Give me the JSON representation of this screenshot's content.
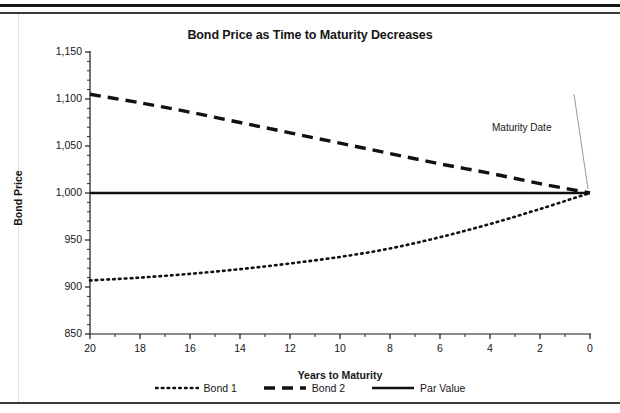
{
  "chart_data": {
    "type": "line",
    "title": "Bond Price as Time to Maturity Decreases",
    "xlabel": "Years to Maturity",
    "ylabel": "Bond Price",
    "xlim": [
      20,
      0
    ],
    "ylim": [
      850,
      1150
    ],
    "x_reversed": true,
    "grid": false,
    "legend_position": "bottom",
    "x_ticks": [
      20,
      18,
      16,
      14,
      12,
      10,
      8,
      6,
      4,
      2,
      0
    ],
    "x_tick_labels": [
      "20",
      "18",
      "16",
      "14",
      "12",
      "10",
      "8",
      "6",
      "4",
      "2",
      "0"
    ],
    "x_minor_tick_interval": 1,
    "y_ticks": [
      850,
      900,
      950,
      1000,
      1050,
      1100,
      1150
    ],
    "y_tick_labels": [
      "850",
      "900",
      "950",
      "1,000",
      "1,050",
      "1,100",
      "1,150"
    ],
    "y_minor_tick_interval": 10,
    "x": [
      20,
      18,
      16,
      14,
      12,
      10,
      8,
      6,
      4,
      2,
      0
    ],
    "series": [
      {
        "name": "Bond 1",
        "style": "dotted",
        "color": "#111111",
        "values": [
          907,
          910,
          914,
          919,
          925,
          932,
          941,
          953,
          967,
          983,
          1000
        ]
      },
      {
        "name": "Bond 2",
        "style": "dashed",
        "color": "#111111",
        "values": [
          1105,
          1096,
          1086,
          1075,
          1064,
          1053,
          1042,
          1031,
          1021,
          1010,
          1000
        ]
      },
      {
        "name": "Par Value",
        "style": "solid",
        "color": "#111111",
        "values": [
          1000,
          1000,
          1000,
          1000,
          1000,
          1000,
          1000,
          1000,
          1000,
          1000,
          1000
        ]
      }
    ],
    "annotations": [
      {
        "text": "Maturity Date",
        "x": 0,
        "y": 1000,
        "label_position": "upper-left"
      }
    ]
  },
  "legend": {
    "items": [
      {
        "label": "Bond 1",
        "style": "dotted"
      },
      {
        "label": "Bond 2",
        "style": "dashed"
      },
      {
        "label": "Par Value",
        "style": "solid"
      }
    ]
  },
  "colors": {
    "ink": "#111111",
    "rule": "#3a3a3a",
    "background": "#ffffff"
  }
}
